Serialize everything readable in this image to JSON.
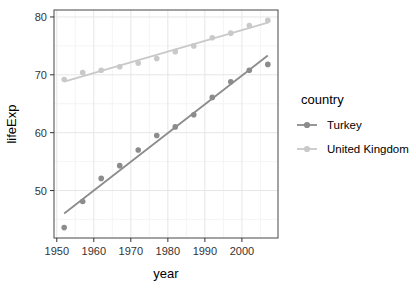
{
  "chart_data": {
    "type": "scatter",
    "title": "",
    "xlabel": "year",
    "ylabel": "lifeExp",
    "legend_title": "country",
    "legend_position": "right",
    "grid": true,
    "x": [
      1952,
      1957,
      1962,
      1967,
      1972,
      1977,
      1982,
      1987,
      1992,
      1997,
      2002,
      2007
    ],
    "series": [
      {
        "name": "Turkey",
        "color": "#8c8c8c",
        "trend": true,
        "values": [
          43.6,
          48.1,
          52.1,
          54.3,
          57.0,
          59.5,
          61.0,
          63.1,
          66.1,
          68.8,
          70.8,
          71.8
        ]
      },
      {
        "name": "United Kingdom",
        "color": "#c9c9c9",
        "trend": true,
        "values": [
          69.2,
          70.4,
          70.8,
          71.4,
          72.0,
          72.8,
          74.0,
          75.0,
          76.4,
          77.2,
          78.5,
          79.4
        ]
      }
    ],
    "xlim": [
      1949.25,
      2009.75
    ],
    "ylim": [
      41.8,
      81.2
    ],
    "x_ticks": [
      1950,
      1960,
      1970,
      1980,
      1990,
      2000
    ],
    "y_ticks": [
      50,
      60,
      70,
      80
    ],
    "x_minor_ticks": [
      1955,
      1965,
      1975,
      1985,
      1995,
      2005
    ],
    "y_minor_ticks": [
      45,
      55,
      65,
      75
    ],
    "colors": {
      "panel_background": "#ffffff",
      "panel_border": "#474747",
      "grid_major": "#e6e6e6",
      "grid_minor": "#f3f3f3",
      "tick": "#333333",
      "tick_label": "#333333",
      "axis_title": "#000000"
    }
  }
}
